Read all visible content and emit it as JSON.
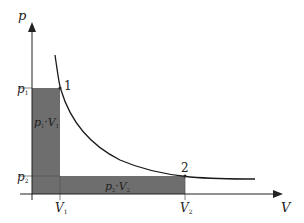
{
  "diagram": {
    "axes": {
      "y_label": "p",
      "x_label": "V"
    },
    "ticks": {
      "p1": "p",
      "p1_sub": "1",
      "p2": "p",
      "p2_sub": "2",
      "V1": "V",
      "V1_sub": "1",
      "V2": "V",
      "V2_sub": "2"
    },
    "points": {
      "point1": "1",
      "point2": "2"
    },
    "areas": {
      "area1": {
        "text": "p",
        "sub1": "1",
        "mid": "·V",
        "sub2": "1"
      },
      "area2": {
        "text": "p",
        "sub1": "2",
        "mid": "·V",
        "sub2": "2"
      }
    },
    "colors": {
      "shade": "#6e6e6e",
      "axis": "#222222",
      "curve": "#1a1a1a"
    }
  }
}
